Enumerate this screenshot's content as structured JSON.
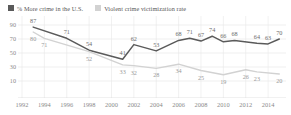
{
  "legend": {
    "items": [
      {
        "label": "% More crime in the U.S.",
        "color": "#5a5a5a",
        "swatch_name": "legend-swatch-more-crime"
      },
      {
        "label": "Violent crime victimization rate",
        "color": "#d2d2d2",
        "swatch_name": "legend-swatch-victimization"
      }
    ]
  },
  "chart_data": {
    "type": "line",
    "title": "",
    "subtitle": "",
    "xlabel": "",
    "ylabel": "",
    "ylim": [
      0,
      100
    ],
    "yticks": [
      10,
      30,
      50,
      70,
      90
    ],
    "grid": true,
    "legend_position": "top-left",
    "x": [
      1993,
      1994,
      1996,
      1998,
      2000,
      2001,
      2002,
      2003,
      2004,
      2005,
      2006,
      2007,
      2008,
      2009,
      2010,
      2011,
      2012,
      2013,
      2014,
      2015
    ],
    "xticks": [
      1992,
      1994,
      1996,
      1998,
      2000,
      2002,
      2004,
      2006,
      2008,
      2010,
      2012,
      2014
    ],
    "series": [
      {
        "name": "% More crime in the U.S.",
        "color": "#5a5a5a",
        "points": [
          {
            "x": 1993,
            "y": 87,
            "label": "87"
          },
          {
            "x": 1996,
            "y": 71,
            "label": "71"
          },
          {
            "x": 1998,
            "y": 54,
            "label": "54"
          },
          {
            "x": 2001,
            "y": 41,
            "label": "41"
          },
          {
            "x": 2002,
            "y": 62,
            "label": "62"
          },
          {
            "x": 2004,
            "y": 53,
            "label": "53"
          },
          {
            "x": 2006,
            "y": 68,
            "label": "68"
          },
          {
            "x": 2007,
            "y": 71,
            "label": "71"
          },
          {
            "x": 2008,
            "y": 67,
            "label": "67"
          },
          {
            "x": 2009,
            "y": 74,
            "label": "74"
          },
          {
            "x": 2010,
            "y": 66,
            "label": "66"
          },
          {
            "x": 2011,
            "y": 68,
            "label": "68"
          },
          {
            "x": 2013,
            "y": 64,
            "label": "64"
          },
          {
            "x": 2014,
            "y": 63,
            "label": "63"
          },
          {
            "x": 2015,
            "y": 70,
            "label": "70"
          }
        ]
      },
      {
        "name": "Violent crime victimization rate",
        "color": "#d2d2d2",
        "points": [
          {
            "x": 1993,
            "y": 80,
            "label": "80"
          },
          {
            "x": 1994,
            "y": 71,
            "label": "71"
          },
          {
            "x": 1998,
            "y": 52,
            "label": "52"
          },
          {
            "x": 2001,
            "y": 33,
            "label": "33"
          },
          {
            "x": 2002,
            "y": 32,
            "label": "32"
          },
          {
            "x": 2004,
            "y": 28,
            "label": "28"
          },
          {
            "x": 2006,
            "y": 34,
            "label": "34"
          },
          {
            "x": 2008,
            "y": 25,
            "label": "25"
          },
          {
            "x": 2010,
            "y": 19,
            "label": "19"
          },
          {
            "x": 2012,
            "y": 26,
            "label": "26"
          },
          {
            "x": 2013,
            "y": 23,
            "label": "23"
          },
          {
            "x": 2015,
            "y": 20,
            "label": "20"
          }
        ]
      }
    ]
  }
}
